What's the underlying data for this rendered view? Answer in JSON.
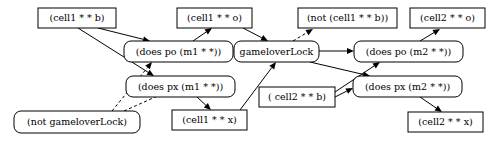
{
  "diagram": {
    "background_color": "#ffffff",
    "stroke_color": "#000000",
    "nodes": [
      {
        "id": "cell1_b",
        "label": "(cell1 * * b)",
        "shape": "rect",
        "x": 38,
        "y": 8,
        "w": 78,
        "h": 20
      },
      {
        "id": "cell1_o",
        "label": "(cell1 * * o)",
        "shape": "rect",
        "x": 177,
        "y": 8,
        "w": 75,
        "h": 20
      },
      {
        "id": "not_cell1_b",
        "label": "(not (cell1 * * b))",
        "shape": "rect",
        "x": 298,
        "y": 8,
        "w": 99,
        "h": 20
      },
      {
        "id": "cell2_o",
        "label": "(cell2 * * o)",
        "shape": "rect",
        "x": 410,
        "y": 8,
        "w": 75,
        "h": 20
      },
      {
        "id": "does_po_m1",
        "label": "(does po (m1 * *))",
        "shape": "round",
        "x": 124,
        "y": 41,
        "w": 109,
        "h": 21
      },
      {
        "id": "gameloverlock",
        "label": "gameloverLock",
        "shape": "round",
        "x": 234,
        "y": 41,
        "w": 85,
        "h": 21
      },
      {
        "id": "does_po_m2",
        "label": "(does po (m2 * *))",
        "shape": "round",
        "x": 354,
        "y": 41,
        "w": 109,
        "h": 21
      },
      {
        "id": "does_px_m1",
        "label": "(does px (m1 * *))",
        "shape": "round",
        "x": 126,
        "y": 76,
        "w": 109,
        "h": 21
      },
      {
        "id": "does_px_m2",
        "label": "(does px (m2 * *))",
        "shape": "round",
        "x": 353,
        "y": 76,
        "w": 109,
        "h": 21
      },
      {
        "id": "cell2_b",
        "label": "( cell2 * * b)",
        "shape": "rect",
        "x": 259,
        "y": 87,
        "w": 76,
        "h": 20
      },
      {
        "id": "not_gameloverlock",
        "label": "(not gameloverLock)",
        "shape": "round",
        "x": 14,
        "y": 111,
        "w": 126,
        "h": 22
      },
      {
        "id": "cell1_x",
        "label": "(cell1 * * x)",
        "shape": "rect",
        "x": 172,
        "y": 110,
        "w": 75,
        "h": 20
      },
      {
        "id": "cell2_x",
        "label": "(cell2 * * x)",
        "shape": "rect",
        "x": 408,
        "y": 112,
        "w": 75,
        "h": 20
      }
    ],
    "edges": [
      {
        "id": "e1",
        "from": "cell1_b",
        "to": "does_po_m1",
        "style": "solid",
        "x1": 98,
        "y1": 28,
        "x2": 150,
        "y2": 41
      },
      {
        "id": "e2",
        "from": "cell1_b",
        "to": "does_px_m1",
        "style": "solid",
        "x1": 78,
        "y1": 28,
        "x2": 154,
        "y2": 76
      },
      {
        "id": "e3",
        "from": "does_po_m1",
        "to": "cell1_o",
        "style": "solid",
        "x1": 193,
        "y1": 41,
        "x2": 212,
        "y2": 28
      },
      {
        "id": "e4",
        "from": "does_po_m1",
        "to": "gameloverlock",
        "style": "solid",
        "x1": 233,
        "y1": 51,
        "x2": 234,
        "y2": 51
      },
      {
        "id": "e5",
        "from": "cell1_o",
        "to": "gameloverlock",
        "style": "solid",
        "x1": 243,
        "y1": 28,
        "x2": 268,
        "y2": 41
      },
      {
        "id": "e6",
        "from": "gameloverlock",
        "to": "not_cell1_b",
        "style": "dashed",
        "x1": 293,
        "y1": 41,
        "x2": 313,
        "y2": 29
      },
      {
        "id": "e7",
        "from": "gameloverlock",
        "to": "does_po_m2",
        "style": "solid",
        "x1": 319,
        "y1": 51,
        "x2": 354,
        "y2": 51
      },
      {
        "id": "e8",
        "from": "does_po_m2",
        "to": "cell2_o",
        "style": "solid",
        "x1": 420,
        "y1": 41,
        "x2": 440,
        "y2": 29
      },
      {
        "id": "e9",
        "from": "gameloverlock",
        "to": "does_px_m2",
        "style": "solid",
        "x1": 310,
        "y1": 62,
        "x2": 370,
        "y2": 76
      },
      {
        "id": "e10",
        "from": "does_px_m2",
        "to": "cell2_x",
        "style": "solid",
        "x1": 420,
        "y1": 97,
        "x2": 442,
        "y2": 112
      },
      {
        "id": "e11",
        "from": "cell2_b",
        "to": "does_po_m2",
        "style": "solid",
        "x1": 335,
        "y1": 92,
        "x2": 380,
        "y2": 62
      },
      {
        "id": "e12",
        "from": "cell2_b",
        "to": "does_px_m2",
        "style": "solid",
        "x1": 335,
        "y1": 97,
        "x2": 353,
        "y2": 88
      },
      {
        "id": "e13",
        "from": "does_px_m1",
        "to": "cell1_x",
        "style": "solid",
        "x1": 197,
        "y1": 97,
        "x2": 211,
        "y2": 110
      },
      {
        "id": "e14",
        "from": "cell1_x",
        "to": "gameloverlock",
        "style": "solid",
        "x1": 240,
        "y1": 110,
        "x2": 276,
        "y2": 62
      },
      {
        "id": "e15",
        "from": "not_gameloverlock",
        "to": "does_po_m1",
        "style": "dashed",
        "x1": 112,
        "y1": 111,
        "x2": 152,
        "y2": 62
      },
      {
        "id": "e16",
        "from": "not_gameloverlock",
        "to": "does_px_m1",
        "style": "dashed",
        "x1": 124,
        "y1": 111,
        "x2": 171,
        "y2": 90
      }
    ]
  }
}
